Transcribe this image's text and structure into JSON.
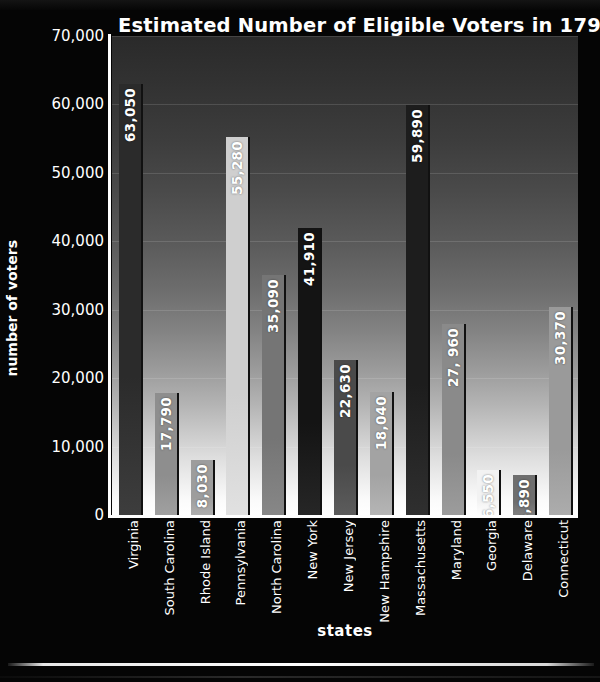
{
  "chart_data": {
    "type": "bar",
    "title": "Estimated Number of Eligible Voters in 1790",
    "xlabel": "states",
    "ylabel": "number of voters",
    "ylim": [
      0,
      70000
    ],
    "grid": true,
    "legend": "none",
    "yticks": [
      "70,000",
      "60,000",
      "50,000",
      "40,000",
      "30,000",
      "20,000",
      "10,000",
      "0"
    ],
    "ytick_values": [
      70000,
      60000,
      50000,
      40000,
      30000,
      20000,
      10000,
      0
    ],
    "categories": [
      "Virginia",
      "South Carolina",
      "Rhode Island",
      "Pennsylvania",
      "North Carolina",
      "New York",
      "New Jersey",
      "New Hampshire",
      "Massachusetts",
      "Maryland",
      "Georgia",
      "Delaware",
      "Connecticut"
    ],
    "values": [
      63050,
      17790,
      8030,
      55280,
      35090,
      41910,
      22630,
      18040,
      59890,
      27960,
      6550,
      5890,
      30370
    ],
    "value_labels": [
      "63,050",
      "17,790",
      "8,030",
      "55,280",
      "35,090",
      "41,910",
      "22,630",
      "18,040",
      "59,890",
      "27, 960",
      "6,550",
      "5,890",
      "30,370"
    ],
    "bar_colors": [
      "#2b2b2b",
      "#8e8e8e",
      "#9d9d9d",
      "#cfcfcf",
      "#757575",
      "#141414",
      "#4a4a4a",
      "#a3a3a3",
      "#1d1d1d",
      "#8a8a8a",
      "#f2f2f2",
      "#6e6e6e",
      "#9a9a9a"
    ]
  },
  "theme": {
    "background": "#000000",
    "text_color": "#ffffff",
    "plot_top_color": "#2a2a2a",
    "plot_bottom_color": "#ffffff",
    "axis_color": "#ffffff"
  }
}
